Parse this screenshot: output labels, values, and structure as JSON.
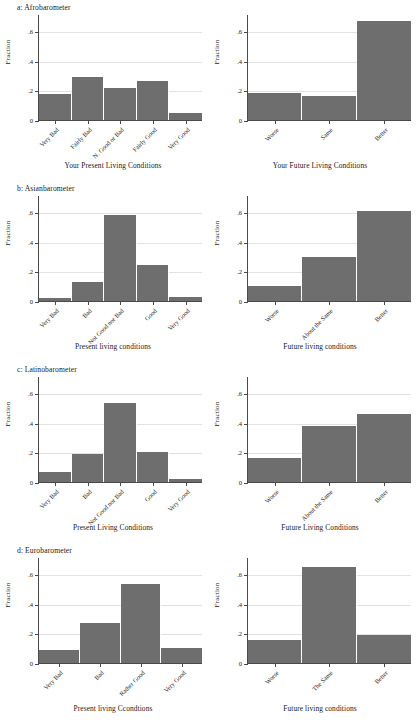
{
  "figure": {
    "y_axis_title": "Fraction",
    "y_ticks": [
      "0",
      ".2",
      ".4",
      ".6"
    ],
    "y_max": 0.7,
    "bar_color": "#6e6e6e",
    "grid_color": "#e2e2e2",
    "axis_color": "#4a4a4a",
    "background": "#ffffff"
  },
  "panels": [
    {
      "id": "afrobarometer-present",
      "title": "a: Afrobarometer",
      "show_title": true,
      "x_title": "Your Present Living Conditions",
      "categories": [
        "Very Bad",
        "Fairly Bad",
        "N. Good or Bad",
        "Fairly Good",
        "Very Good"
      ],
      "values": [
        0.175,
        0.29,
        0.215,
        0.265,
        0.045
      ]
    },
    {
      "id": "afrobarometer-future",
      "title": "",
      "show_title": false,
      "x_title": "Your Future Living Conditions",
      "categories": [
        "Worse",
        "Same",
        "Better"
      ],
      "values": [
        0.185,
        0.165,
        0.665
      ]
    },
    {
      "id": "asianbarometer-present",
      "title": "b: Asianbarometer",
      "show_title": true,
      "x_title": "Present living conditions",
      "categories": [
        "Very Bad",
        "Bad",
        "Not Good nor Bad",
        "Good",
        "Very Good"
      ],
      "values": [
        0.02,
        0.125,
        0.58,
        0.245,
        0.025
      ]
    },
    {
      "id": "asianbarometer-future",
      "title": "",
      "show_title": false,
      "x_title": "Future living conditions",
      "categories": [
        "Worse",
        "About the Same",
        "Better"
      ],
      "values": [
        0.1,
        0.295,
        0.605
      ]
    },
    {
      "id": "latinobarometer-present",
      "title": "c: Latinobarometer",
      "show_title": true,
      "x_title": "Present Living Conditions",
      "categories": [
        "Very Bad",
        "Bad",
        "Not Good nor Bad",
        "Good",
        "Very Good"
      ],
      "values": [
        0.065,
        0.19,
        0.53,
        0.2,
        0.02
      ]
    },
    {
      "id": "latinobarometer-future",
      "title": "",
      "show_title": false,
      "x_title": "Future Living Conditions",
      "categories": [
        "Worse",
        "About the Same",
        "Better"
      ],
      "values": [
        0.16,
        0.375,
        0.46
      ]
    },
    {
      "id": "eurobarometer-present",
      "title": "d: Eurobarometer",
      "show_title": true,
      "x_title": "Present living Ccondtions",
      "categories": [
        "Very Bad",
        "Bad",
        "Rather Good",
        "Very Good"
      ],
      "values": [
        0.09,
        0.27,
        0.535,
        0.1
      ]
    },
    {
      "id": "eurobarometer-future",
      "title": "",
      "show_title": false,
      "x_title": "Future living conditions",
      "categories": [
        "Worse",
        "The Same",
        "Better"
      ],
      "values": [
        0.155,
        0.645,
        0.19
      ]
    }
  ],
  "chart_data": {
    "type": "bar",
    "ylabel": "Fraction",
    "ylim": [
      0,
      0.7
    ],
    "yticks": [
      0,
      0.2,
      0.4,
      0.6
    ],
    "grid": true,
    "legend": "none",
    "bar_color": "#6e6e6e",
    "panels": [
      {
        "panel": "a: Afrobarometer",
        "subplot": "left",
        "xlabel": "Your Present Living Conditions",
        "categories": [
          "Very Bad",
          "Fairly Bad",
          "N. Good or Bad",
          "Fairly Good",
          "Very Good"
        ],
        "values": [
          0.175,
          0.29,
          0.215,
          0.265,
          0.045
        ]
      },
      {
        "panel": "a: Afrobarometer",
        "subplot": "right",
        "xlabel": "Your Future Living Conditions",
        "categories": [
          "Worse",
          "Same",
          "Better"
        ],
        "values": [
          0.185,
          0.165,
          0.665
        ]
      },
      {
        "panel": "b: Asianbarometer",
        "subplot": "left",
        "xlabel": "Present living conditions",
        "categories": [
          "Very Bad",
          "Bad",
          "Not Good nor Bad",
          "Good",
          "Very Good"
        ],
        "values": [
          0.02,
          0.125,
          0.58,
          0.245,
          0.025
        ]
      },
      {
        "panel": "b: Asianbarometer",
        "subplot": "right",
        "xlabel": "Future living conditions",
        "categories": [
          "Worse",
          "About the Same",
          "Better"
        ],
        "values": [
          0.1,
          0.295,
          0.605
        ]
      },
      {
        "panel": "c: Latinobarometer",
        "subplot": "left",
        "xlabel": "Present Living Conditions",
        "categories": [
          "Very Bad",
          "Bad",
          "Not Good nor Bad",
          "Good",
          "Very Good"
        ],
        "values": [
          0.065,
          0.19,
          0.53,
          0.2,
          0.02
        ]
      },
      {
        "panel": "c: Latinobarometer",
        "subplot": "right",
        "xlabel": "Future Living Conditions",
        "categories": [
          "Worse",
          "About the Same",
          "Better"
        ],
        "values": [
          0.16,
          0.375,
          0.46
        ]
      },
      {
        "panel": "d: Eurobarometer",
        "subplot": "left",
        "xlabel": "Present living Ccondtions",
        "categories": [
          "Very Bad",
          "Bad",
          "Rather Good",
          "Very Good"
        ],
        "values": [
          0.09,
          0.27,
          0.535,
          0.1
        ]
      },
      {
        "panel": "d: Eurobarometer",
        "subplot": "right",
        "xlabel": "Future living conditions",
        "categories": [
          "Worse",
          "The Same",
          "Better"
        ],
        "values": [
          0.155,
          0.645,
          0.19
        ]
      }
    ]
  }
}
